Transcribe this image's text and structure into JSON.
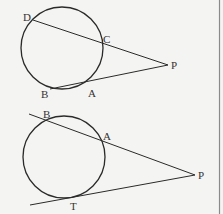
{
  "figures": [
    {
      "id": "secant-secant",
      "circle": {
        "cx": 62,
        "cy": 48,
        "r": 41
      },
      "points": {
        "D": {
          "label": "D",
          "x": 33,
          "y": 20
        },
        "C": {
          "label": "C",
          "x": 102,
          "y": 42
        },
        "P": {
          "label": "P",
          "x": 168,
          "y": 65
        },
        "A": {
          "label": "A",
          "x": 88,
          "y": 83
        },
        "B": {
          "label": "B",
          "x": 50,
          "y": 89
        }
      },
      "segments": [
        [
          "D",
          "P"
        ],
        [
          "B",
          "P"
        ]
      ]
    },
    {
      "id": "secant-tangent",
      "circle": {
        "cx": 64,
        "cy": 157,
        "r": 41
      },
      "points": {
        "B": {
          "label": "B",
          "x": 48,
          "y": 120
        },
        "A": {
          "label": "A",
          "x": 101,
          "y": 138
        },
        "P": {
          "label": "P",
          "x": 195,
          "y": 175
        },
        "T": {
          "label": "T",
          "x": 68,
          "y": 198
        }
      },
      "segments": [
        [
          "secant-start",
          "P"
        ],
        [
          "tangent-start",
          "P"
        ]
      ]
    }
  ],
  "labels": {
    "top": {
      "D": "D",
      "C": "C",
      "P": "P",
      "A": "A",
      "B": "B"
    },
    "bottom": {
      "B": "B",
      "A": "A",
      "P": "P",
      "T": "T"
    }
  },
  "colors": {
    "line": "#2a2a2a",
    "background": "#f4f4f2",
    "border": "#888888"
  }
}
